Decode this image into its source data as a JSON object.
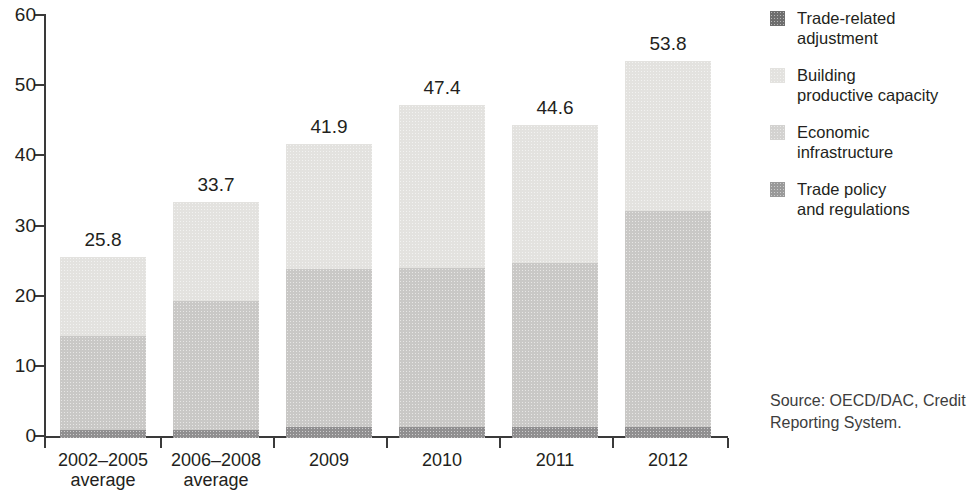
{
  "chart_data": {
    "type": "bar",
    "subtype": "stacked-vertical",
    "title": "",
    "subtitle": "",
    "xlabel": "",
    "ylabel": "",
    "ylim": [
      0,
      60
    ],
    "ytick_step": 10,
    "ytick_labels": [
      "60",
      "50",
      "40",
      "30",
      "20",
      "10",
      "0"
    ],
    "ytick_values": [
      60,
      50,
      40,
      30,
      20,
      10,
      0
    ],
    "grid": false,
    "legend_position": "right",
    "categories": [
      "2002–2005 average",
      "2006–2008 average",
      "2009",
      "2010",
      "2011",
      "2012"
    ],
    "category_lines": [
      [
        "2002–2005",
        "average"
      ],
      [
        "2006–2008",
        "average"
      ],
      [
        "2009",
        ""
      ],
      [
        "2010",
        ""
      ],
      [
        "2011",
        ""
      ],
      [
        "2012",
        ""
      ]
    ],
    "totals": [
      25.8,
      33.7,
      41.9,
      47.4,
      44.6,
      53.8
    ],
    "total_labels": [
      "25.8",
      "33.7",
      "41.9",
      "47.4",
      "44.6",
      "53.8"
    ],
    "series": [
      {
        "name": "Trade policy and regulations",
        "color": "#908f90",
        "values": [
          1.2,
          1.2,
          1.6,
          1.6,
          1.5,
          1.5
        ]
      },
      {
        "name": "Economic infrastructure",
        "color": "#c9c8c6",
        "values": [
          13.3,
          18.4,
          22.5,
          22.6,
          23.5,
          30.8
        ]
      },
      {
        "name": "Building productive capacity",
        "color": "#e3e2df",
        "values": [
          11.3,
          14.1,
          17.8,
          23.2,
          19.6,
          21.5
        ]
      },
      {
        "name": "Trade-related adjustment",
        "color": "#6e6e6e",
        "values": [
          0.0,
          0.0,
          0.0,
          0.0,
          0.0,
          0.0
        ]
      }
    ]
  },
  "legend": {
    "items": [
      {
        "label_line1": "Trade-related",
        "label_line2": "adjustment",
        "color": "#6e6e6e",
        "swatch_name": "legend-swatch-trade-related-adjustment"
      },
      {
        "label_line1": "Building",
        "label_line2": "productive capacity",
        "color": "#e3e2df",
        "swatch_name": "legend-swatch-building-productive-capacity"
      },
      {
        "label_line1": "Economic infrastructure",
        "label_line2": "",
        "color": "#d3d2d0",
        "swatch_name": "legend-swatch-economic-infrastructure"
      },
      {
        "label_line1": "Trade policy",
        "label_line2": "and regulations",
        "color": "#9a9a9a",
        "swatch_name": "legend-swatch-trade-policy-and-regulations"
      }
    ]
  },
  "source": {
    "line1": "Source:  OECD/DAC, Credit",
    "line2": "Reporting System."
  },
  "colors": {
    "axis": "#3a3a3a",
    "text": "#231f20",
    "background": "#ffffff"
  }
}
